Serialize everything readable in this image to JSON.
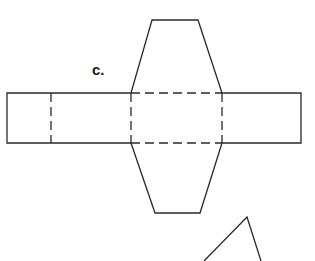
{
  "figure": {
    "label": "c.",
    "colors": {
      "line": "#2a2a2a",
      "background": "#ffffff"
    },
    "line_styles": {
      "cut_edges": "solid",
      "fold_lines": "dashed"
    }
  }
}
